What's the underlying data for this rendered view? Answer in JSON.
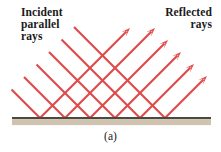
{
  "figure": {
    "caption": "(a)",
    "labels": {
      "incident": "Incident\nparallel\nrays",
      "reflected": "Reflected\nrays"
    },
    "colors": {
      "ray": "#e04a4a",
      "ray_core": "#d93a3a",
      "mirror_line": "#4a4a42",
      "mirror_band": "#cfc3b0",
      "background": "#ffffff",
      "text": "#1a1a1a"
    },
    "geometry": {
      "width": 221,
      "height": 152,
      "mirror_y": 118,
      "mirror_x_start": 12,
      "mirror_x_end": 211,
      "mirror_line_thickness": 2.2,
      "mirror_band_thickness": 6,
      "ray_angle_degrees": 45,
      "ray_count": 6,
      "ray_stroke_width": 2.1,
      "arrowhead_length": 9,
      "arrowhead_half_width": 3.2
    },
    "chart_data": {
      "type": "line",
      "title": "Specular reflection of parallel rays from a plane mirror",
      "description": "Six parallel incident rays travel down and to the right at 45 degrees, strike a plane mirror, and reflect up and to the right at 45 degrees with equal angle of incidence and reflection.",
      "incident_rays": [
        {
          "index": 1,
          "x_start": 74.0,
          "y_start": 27.0,
          "x_hit": 165.0,
          "y_hit": 118.0
        },
        {
          "index": 2,
          "x_start": 61.5,
          "y_start": 39.5,
          "x_hit": 140.0,
          "y_hit": 118.0
        },
        {
          "index": 3,
          "x_start": 49.0,
          "y_start": 52.0,
          "x_hit": 115.0,
          "y_hit": 118.0
        },
        {
          "index": 4,
          "x_start": 36.5,
          "y_start": 64.5,
          "x_hit": 90.0,
          "y_hit": 118.0
        },
        {
          "index": 5,
          "x_start": 24.0,
          "y_start": 77.0,
          "x_hit": 65.0,
          "y_hit": 118.0
        },
        {
          "index": 6,
          "x_start": 11.5,
          "y_start": 89.5,
          "x_hit": 40.0,
          "y_hit": 118.0
        }
      ],
      "reflected_rays": [
        {
          "index": 1,
          "x_hit": 40.0,
          "y_hit": 118.0,
          "x_end": 130.0,
          "y_end": 28.0
        },
        {
          "index": 2,
          "x_hit": 65.0,
          "y_hit": 118.0,
          "x_end": 155.0,
          "y_end": 28.0
        },
        {
          "index": 3,
          "x_hit": 90.0,
          "y_hit": 118.0,
          "x_end": 168.0,
          "y_end": 40.0
        },
        {
          "index": 4,
          "x_hit": 115.0,
          "y_hit": 118.0,
          "x_end": 181.0,
          "y_end": 52.0
        },
        {
          "index": 5,
          "x_hit": 140.0,
          "y_hit": 118.0,
          "x_end": 194.0,
          "y_end": 64.0
        },
        {
          "index": 6,
          "x_hit": 165.0,
          "y_hit": 118.0,
          "x_end": 207.0,
          "y_end": 76.0
        }
      ]
    }
  }
}
